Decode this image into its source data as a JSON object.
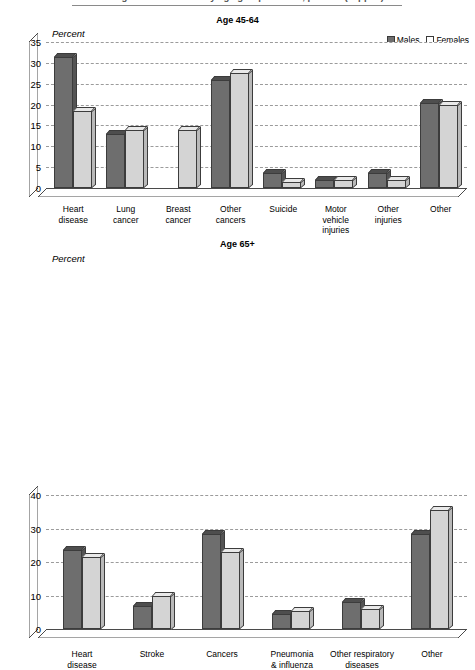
{
  "figure": {
    "title_cut_off": "Leading causes of death by age group and sex, percent (clipped)",
    "rule_visible": true
  },
  "legend": {
    "position": "top-right",
    "entries": [
      {
        "label": "Males",
        "color": "#6e6e6e",
        "icon": "legend-swatch-males"
      },
      {
        "label": "Females",
        "color": "#ffffff",
        "icon": "legend-swatch-females"
      }
    ]
  },
  "colors": {
    "males": "#6e6e6e",
    "females": "#d4d4d4",
    "grid": "#9b9b9b",
    "axis": "#4a4a4a",
    "text": "#000000",
    "background": "#ffffff"
  },
  "chart_data": [
    {
      "type": "bar",
      "title": "Age 45-64",
      "ylabel": "Percent",
      "xlabel": "",
      "ylim": [
        0,
        35
      ],
      "yticks": [
        35,
        30,
        25,
        20,
        15,
        10,
        5,
        0
      ],
      "grid": true,
      "legend_position": "top-right",
      "categories": [
        "Heart disease",
        "Lung cancer",
        "Breast cancer",
        "Other cancers",
        "Suicide",
        "Motor vehicle injuries",
        "Other injuries",
        "Other"
      ],
      "series": [
        {
          "name": "Males",
          "values": [
            31.5,
            13.0,
            null,
            26.0,
            3.5,
            2.0,
            3.5,
            20.5
          ]
        },
        {
          "name": "Females",
          "values": [
            18.5,
            14.0,
            14.0,
            27.5,
            1.5,
            2.0,
            2.0,
            20.0
          ]
        }
      ]
    },
    {
      "type": "bar",
      "title": "Age 65+",
      "ylabel": "Percent",
      "xlabel": "",
      "ylim": [
        0,
        40
      ],
      "yticks": [
        40,
        30,
        20,
        10,
        0
      ],
      "grid": true,
      "legend_position": "none",
      "categories": [
        "Heart disease",
        "Stroke",
        "Cancers",
        "Pneumonia & influenza",
        "Other respiratory diseases",
        "Other"
      ],
      "series": [
        {
          "name": "Males",
          "values": [
            23.5,
            7.0,
            28.5,
            4.5,
            8.0,
            28.5
          ]
        },
        {
          "name": "Females",
          "values": [
            21.5,
            10.0,
            23.0,
            5.5,
            6.0,
            35.5
          ]
        }
      ]
    }
  ],
  "panel1": {
    "title": "Age 45-64",
    "ylabel": "Percent",
    "yticks": [
      "35",
      "30",
      "25",
      "20",
      "15",
      "10",
      "5",
      "0"
    ],
    "categories": [
      "Heart\ndisease",
      "Lung\ncancer",
      "Breast\ncancer",
      "Other\ncancers",
      "Suicide",
      "Motor\nvehicle\ninjuries",
      "Other\ninjuries",
      "Other"
    ]
  },
  "panel2": {
    "title": "Age 65+",
    "ylabel": "Percent",
    "yticks": [
      "40",
      "30",
      "20",
      "10",
      "0"
    ],
    "categories": [
      "Heart\ndisease",
      "Stroke",
      "Cancers",
      "Pneumonia\n& influenza",
      "Other respiratory\ndiseases",
      "Other"
    ]
  }
}
